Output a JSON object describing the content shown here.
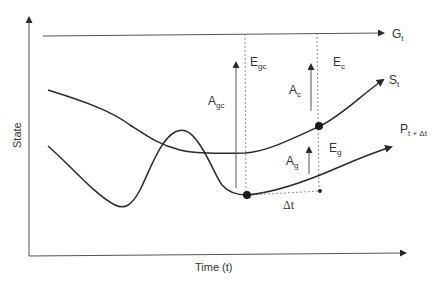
{
  "diagram": {
    "axes": {
      "x_label": "Time (t)",
      "y_label": "State"
    },
    "lines": {
      "goal": {
        "main": "G",
        "sub": "t"
      },
      "state": {
        "main": "S",
        "sub": "t"
      },
      "projection": {
        "main": "P",
        "sub": "t + Δt"
      }
    },
    "annotations": {
      "a_gc": {
        "main": "A",
        "sub": "gc"
      },
      "e_gc": {
        "main": "E",
        "sub": "gc"
      },
      "a_c": {
        "main": "A",
        "sub": "c"
      },
      "e_c": {
        "main": "E",
        "sub": "c"
      },
      "a_g": {
        "main": "A",
        "sub": "g"
      },
      "e_g": {
        "main": "E",
        "sub": "g"
      },
      "delta_t": "Δt"
    },
    "colors": {
      "line": "#2a2a2a",
      "text": "#333333",
      "background": "#ffffff"
    }
  }
}
